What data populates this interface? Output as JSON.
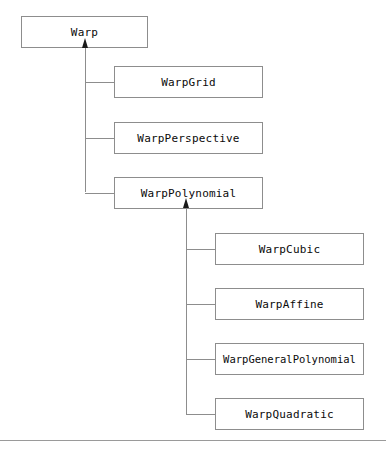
{
  "diagram": {
    "type": "uml-class-hierarchy",
    "colors": {
      "box_border": "#8d8d8d",
      "box_fill": "#ffffff",
      "connector": "#8d8d8d",
      "arrowhead": "#1a1a1a",
      "text": "#0a0a0a",
      "footer_rule": "#9a9a9a",
      "background": "#ffffff"
    },
    "root": {
      "label": "Warp",
      "x": 21,
      "y": 16,
      "w": 127,
      "h": 32
    },
    "level1": {
      "trunk_x": 85,
      "trunk_top": 48,
      "trunk_bottom": 192,
      "arrow_x": 82,
      "arrow_y": 38,
      "box_left": 114,
      "box_right": 263,
      "box_width": 149,
      "box_height": 32,
      "nodes": [
        {
          "label": "WarpGrid",
          "y": 66,
          "connector_y": 82
        },
        {
          "label": "WarpPerspective",
          "y": 122,
          "connector_y": 138
        },
        {
          "label": "WarpPolynomial",
          "y": 177,
          "connector_y": 193
        }
      ]
    },
    "level2": {
      "parent": "WarpPolynomial",
      "trunk_x": 186,
      "trunk_top": 208,
      "trunk_bottom": 414,
      "arrow_x": 183,
      "arrow_y": 198,
      "box_left": 215,
      "box_right": 364,
      "box_width": 149,
      "box_height": 32,
      "nodes": [
        {
          "label": "WarpCubic",
          "y": 233,
          "connector_y": 249,
          "tight": false
        },
        {
          "label": "WarpAffine",
          "y": 288,
          "connector_y": 304,
          "tight": false
        },
        {
          "label": "WarpGeneralPolynomial",
          "y": 343,
          "connector_y": 359,
          "tight": true
        },
        {
          "label": "WarpQuadratic",
          "y": 398,
          "connector_y": 414,
          "tight": false
        }
      ]
    },
    "footer_rule": {
      "y": 440,
      "width": 386
    }
  }
}
